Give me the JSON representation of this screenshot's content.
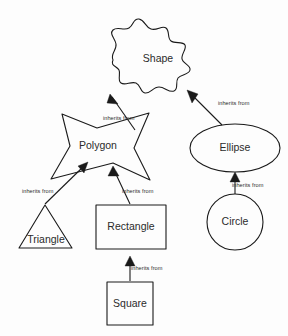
{
  "diagram": {
    "type": "class-inheritance-diagram",
    "canvas": {
      "width": 288,
      "height": 336
    },
    "colors": {
      "background": "#fdfdfd",
      "stroke": "#1a1a1a",
      "text": "#2b2b2b",
      "arrow_fill": "#1a1a1a"
    }
  },
  "nodes": [
    {
      "id": "shape",
      "label": "Shape",
      "glyph": "blob",
      "label_x": 158,
      "label_y": 59,
      "path": "M 113 60 C 110 54 117 50 116 44 C 115 38 109 34 113 30 C 117 26 124 31 129 28 C 134 25 133 18 139 19 C 145 20 145 27 151 29 C 157 31 162 25 166 28 C 170 31 167 38 171 41 C 175 44 183 41 185 45 C 187 49 181 54 182 59 C 183 64 191 65 190 70 C 189 75 181 74 178 78 C 175 82 179 89 174 91 C 169 93 165 87 159 87 C 153 87 150 94 145 93 C 140 92 141 85 136 83 C 131 81 125 86 121 83 C 117 80 121 74 119 70 C 117 66 110 66 113 60 Z"
    },
    {
      "id": "polygon",
      "label": "Polygon",
      "glyph": "star-arrow",
      "label_x": 98,
      "label_y": 146,
      "path": "M 62 114 L 97 128 L 149 113 L 134 148 L 150 180 L 113 163 L 51 179 L 70 146 Z"
    },
    {
      "id": "ellipse",
      "label": "Ellipse",
      "glyph": "ellipse",
      "label_x": 235,
      "label_y": 148,
      "cx": 235,
      "cy": 148,
      "rx": 45,
      "ry": 24
    },
    {
      "id": "circle",
      "label": "Circle",
      "glyph": "circle",
      "label_x": 235,
      "label_y": 222,
      "cx": 235,
      "cy": 222,
      "r": 28
    },
    {
      "id": "triangle",
      "label": "Triangle",
      "glyph": "triangle",
      "label_x": 46,
      "label_y": 240,
      "path": "M 45 205 L 72 248 L 19 248 Z"
    },
    {
      "id": "rectangle",
      "label": "Rectangle",
      "glyph": "rect",
      "label_x": 131,
      "label_y": 227,
      "x": 96,
      "y": 205,
      "w": 70,
      "h": 44
    },
    {
      "id": "square",
      "label": "Square",
      "glyph": "rect",
      "label_x": 130,
      "label_y": 304,
      "x": 107,
      "y": 282,
      "w": 46,
      "h": 43
    }
  ],
  "edges": [
    {
      "id": "polygon-to-shape",
      "from": "polygon",
      "to": "shape",
      "label": "inherits from",
      "label_x": 103,
      "label_y": 119,
      "line": "M 135 130 L 112 97",
      "arrow": "M 110 94 L 118 104 L 107 103 Z"
    },
    {
      "id": "ellipse-to-shape",
      "from": "ellipse",
      "to": "shape",
      "label": "inherits from",
      "label_x": 218,
      "label_y": 104,
      "line": "M 222 125 L 190 93",
      "arrow": "M 187 90 L 198 94 L 192 103 Z"
    },
    {
      "id": "triangle-to-polygon",
      "from": "triangle",
      "to": "polygon",
      "label": "inherits from",
      "label_x": 22,
      "label_y": 192,
      "line": "M 45 204 L 85 165",
      "arrow": "M 88 162 L 84 173 L 78 166 Z"
    },
    {
      "id": "rectangle-to-polygon",
      "from": "rectangle",
      "to": "polygon",
      "label": "inherits from",
      "label_x": 122,
      "label_y": 192,
      "line": "M 130 204 L 114 170",
      "arrow": "M 113 166 L 119 176 L 108 176 Z"
    },
    {
      "id": "circle-to-ellipse",
      "from": "circle",
      "to": "ellipse",
      "label": "inherits from",
      "label_x": 232,
      "label_y": 186,
      "line": "M 235 194 L 235 177",
      "arrow": "M 235 172 L 240 182 L 230 182 Z"
    },
    {
      "id": "square-to-rectangle",
      "from": "square",
      "to": "rectangle",
      "label": "inherits from",
      "label_x": 131,
      "label_y": 269,
      "line": "M 130 281 L 130 262",
      "arrow": "M 130 256 L 135 266 L 125 266 Z"
    }
  ]
}
